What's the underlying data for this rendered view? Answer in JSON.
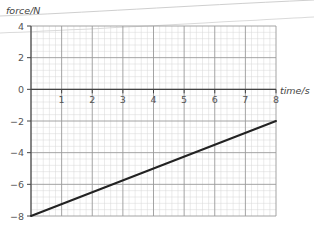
{
  "chart_data": {
    "type": "line",
    "title": "",
    "xlabel": "time/s",
    "ylabel": "force/N",
    "xlim": [
      0,
      8
    ],
    "ylim": [
      -8,
      4
    ],
    "x_ticks": [
      1,
      2,
      3,
      4,
      5,
      6,
      7,
      8
    ],
    "x_tick_labels": [
      "1",
      "2",
      "3",
      "4",
      "5",
      "6",
      "7",
      "8"
    ],
    "y_ticks": [
      4,
      2,
      0,
      -2,
      -4,
      -6,
      -8
    ],
    "y_tick_labels": [
      "4",
      "2",
      "0",
      "−2",
      "−4",
      "−6",
      "−8"
    ],
    "grid": true,
    "grid_minor_subdivisions": 5,
    "legend": null,
    "series": [
      {
        "name": "force",
        "x": [
          0,
          8
        ],
        "y": [
          -8,
          -2
        ],
        "color": "#222222"
      }
    ]
  },
  "colors": {
    "major_grid": "#9a9a9a",
    "minor_grid": "#d6d6d6",
    "axis": "#444444",
    "line": "#222222",
    "crease": "#c8c8c8"
  }
}
